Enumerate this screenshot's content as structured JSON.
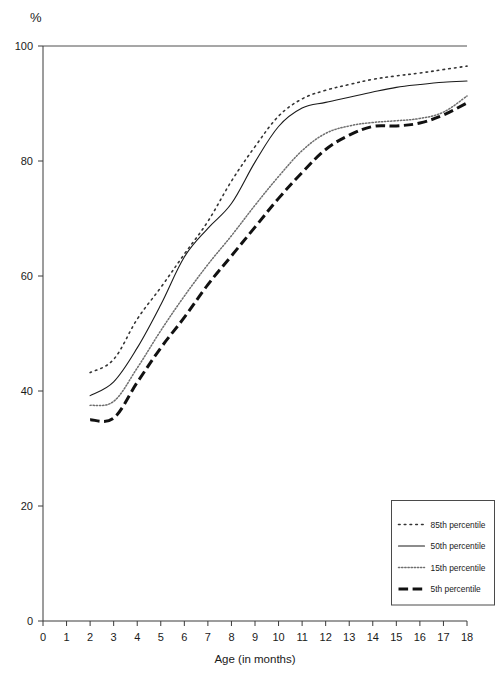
{
  "chart_data": {
    "type": "line",
    "title": "",
    "ylabel": "%",
    "xlabel": "Age (in months)",
    "xlim": [
      0,
      18
    ],
    "ylim": [
      0,
      100
    ],
    "x_ticks": [
      0,
      1,
      2,
      3,
      4,
      5,
      6,
      7,
      8,
      9,
      10,
      11,
      12,
      13,
      14,
      15,
      16,
      17,
      18
    ],
    "y_ticks": [
      0,
      20,
      40,
      60,
      80,
      100
    ],
    "grid": false,
    "legend_position": "bottom-right",
    "x": [
      2,
      3,
      4,
      5,
      6,
      7,
      8,
      9,
      10,
      11,
      12,
      13,
      14,
      15,
      16,
      17,
      18
    ],
    "series": [
      {
        "name": "85th percentile",
        "style": "dotted-sparse",
        "color": "#333333",
        "width": 1.6,
        "values": [
          43.2,
          45.5,
          52.5,
          58.0,
          63.8,
          69.5,
          76.5,
          82.5,
          87.8,
          90.8,
          92.3,
          93.3,
          94.2,
          94.8,
          95.3,
          95.9,
          96.5
        ]
      },
      {
        "name": "50th percentile",
        "style": "solid",
        "color": "#1a1a1a",
        "width": 1.1,
        "values": [
          39.2,
          41.6,
          47.5,
          55.0,
          63.3,
          68.3,
          72.6,
          79.8,
          86.0,
          89.2,
          90.2,
          91.1,
          92.0,
          92.8,
          93.3,
          93.7,
          93.9
        ]
      },
      {
        "name": "15th percentile",
        "style": "dotted-fine",
        "color": "#6e6e6e",
        "width": 1.5,
        "values": [
          37.5,
          38.2,
          44.0,
          50.5,
          56.5,
          62.0,
          67.0,
          72.3,
          77.3,
          81.8,
          84.8,
          86.1,
          86.7,
          87.0,
          87.4,
          88.5,
          91.3
        ]
      },
      {
        "name": "5th percentile",
        "style": "dashed-thick",
        "color": "#111111",
        "width": 3.0,
        "values": [
          35.0,
          35.3,
          41.5,
          47.5,
          52.8,
          58.5,
          63.5,
          68.5,
          73.5,
          78.0,
          82.0,
          84.5,
          86.0,
          86.1,
          86.6,
          88.0,
          90.1
        ]
      }
    ]
  },
  "axis": {
    "y_unit": "%",
    "x_title": "Age (in months)"
  },
  "legend": {
    "items": [
      {
        "label": "85th percentile"
      },
      {
        "label": "50th percentile"
      },
      {
        "label": "15th percentile"
      },
      {
        "label": "5th percentile"
      }
    ]
  }
}
